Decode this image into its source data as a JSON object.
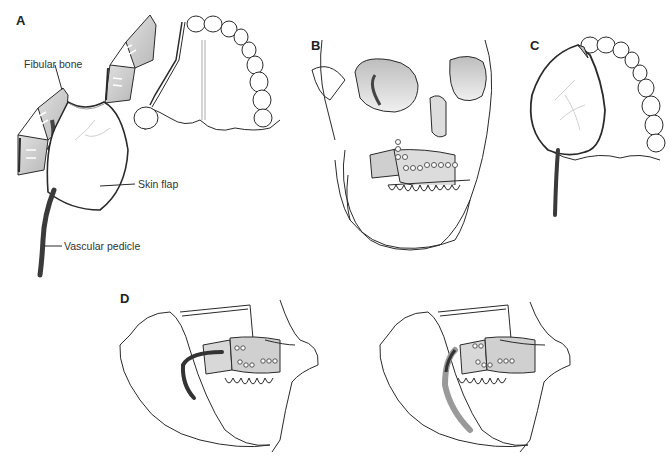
{
  "figure": {
    "panels": [
      {
        "id": "A",
        "label": "A",
        "description": "Fibular osteocutaneous flap with skin paddle and vascular pedicle next to maxillary defect (palatal view)",
        "callouts": [
          {
            "key": "fibular_bone",
            "text": "Fibular bone"
          },
          {
            "key": "skin_flap",
            "text": "Skin flap"
          },
          {
            "key": "vascular_pedicle",
            "text": "Vascular pedicle"
          }
        ]
      },
      {
        "id": "B",
        "label": "B",
        "description": "Fibula segments plated to the maxilla on skull (oblique view)"
      },
      {
        "id": "C",
        "label": "C",
        "description": "Skin flap inset over the palate with pedicle (palatal view)"
      },
      {
        "id": "D",
        "label": "D",
        "description": "Lateral views of face with flap inset and pedicle routing, two variants"
      }
    ],
    "colors": {
      "line": "#2a2a2a",
      "bone_fill": "#c9c9c9",
      "shade_fill": "#dcdcdc",
      "pedicle": "#3a3a3a",
      "pedicle_faded": "#9a9a9a",
      "background": "#ffffff"
    }
  }
}
